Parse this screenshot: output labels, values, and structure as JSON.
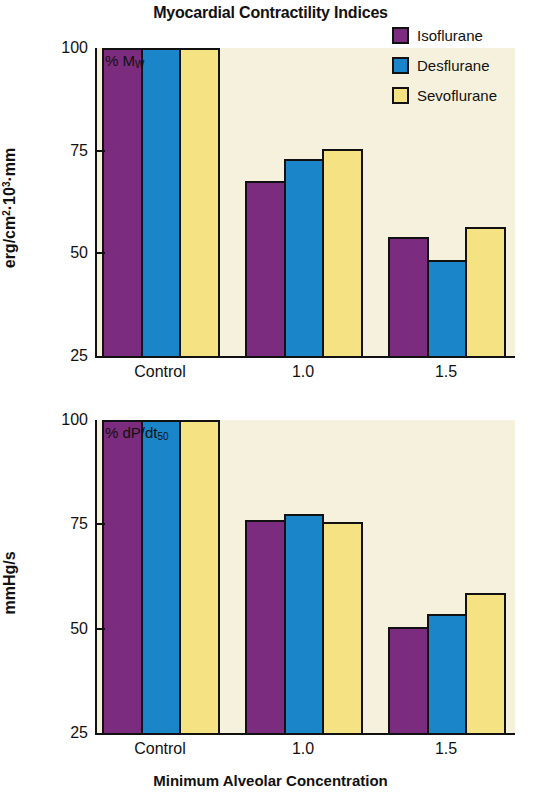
{
  "chart_data": {
    "type": "bar",
    "title": "Myocardial Contractility Indices",
    "xlabel": "Minimum Alveolar Concentration",
    "categories": [
      "Control",
      "1.0",
      "1.5"
    ],
    "legend_position": "top-right",
    "grid": false,
    "panels": [
      {
        "note": "% M",
        "note_sub": "W",
        "ylabel": "erg/cm",
        "ylabel_sup": "2",
        "ylabel_rest": "·10",
        "ylabel_sup2": "3",
        "ylabel_tail": "·mm",
        "ylim": [
          25,
          100
        ],
        "yticks": [
          "100",
          "75",
          "50",
          "25"
        ],
        "ytick_values": [
          100,
          75,
          50,
          25
        ],
        "series": [
          {
            "name": "Isoflurane",
            "values": [
              100,
              67.5,
              54.0
            ]
          },
          {
            "name": "Desflurane",
            "values": [
              100,
              73.0,
              48.5
            ]
          },
          {
            "name": "Sevoflurane",
            "values": [
              100,
              75.5,
              56.5
            ]
          }
        ]
      },
      {
        "note": "% dP/dt",
        "note_sub": "50",
        "ylabel": "mmHg/s",
        "ylim": [
          25,
          100
        ],
        "yticks": [
          "100",
          "75",
          "50",
          "25"
        ],
        "ytick_values": [
          100,
          75,
          50,
          25
        ],
        "series": [
          {
            "name": "Isoflurane",
            "values": [
              100,
              76.0,
              50.5
            ]
          },
          {
            "name": "Desflurane",
            "values": [
              100,
              77.5,
              53.5
            ]
          },
          {
            "name": "Sevoflurane",
            "values": [
              100,
              75.5,
              58.5
            ]
          }
        ]
      }
    ],
    "legend": [
      {
        "label": "Isoflurane",
        "color": "#7B2C7E"
      },
      {
        "label": "Desflurane",
        "color": "#1A85C8"
      },
      {
        "label": "Sevoflurane",
        "color": "#F5E283"
      }
    ],
    "colors": {
      "isoflurane": "#7B2C7E",
      "desflurane": "#1A85C8",
      "sevoflurane": "#F5E283",
      "plot_background": "#f6f1dd",
      "axis": "#111111"
    }
  }
}
